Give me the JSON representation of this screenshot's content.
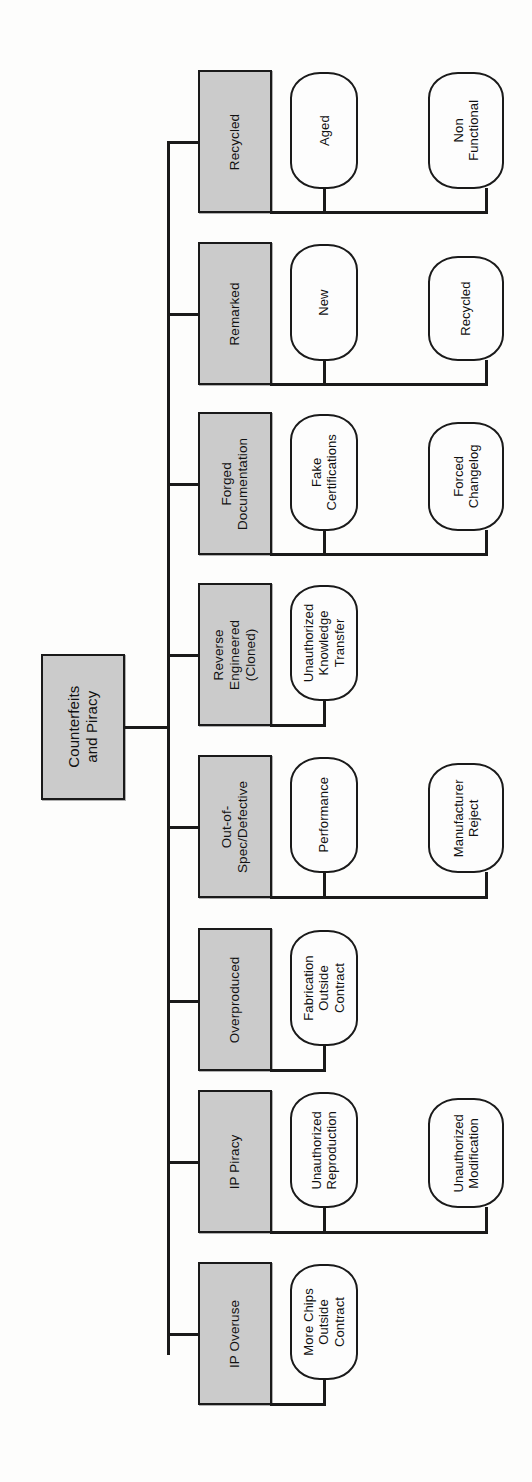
{
  "diagram": {
    "orientation": "rotated-90-ccw",
    "colors": {
      "node_fill_gray": "#cbcbcb",
      "leaf_fill": "#fdfdfd",
      "stroke": "#1a1a1a",
      "background": "#ffffff"
    },
    "root": {
      "label": "Counterfeits\nand Piracy"
    },
    "branches": [
      {
        "label": "Recycled",
        "leaves": [
          {
            "label": "Aged"
          },
          {
            "label": "Non\nFunctional"
          }
        ]
      },
      {
        "label": "Remarked",
        "leaves": [
          {
            "label": "New"
          },
          {
            "label": "Recycled"
          }
        ]
      },
      {
        "label": "Forged\nDocumentation",
        "leaves": [
          {
            "label": "Fake\nCertifications"
          },
          {
            "label": "Forced\nChangelog"
          }
        ]
      },
      {
        "label": "Reverse\nEngineered\n(Cloned)",
        "leaves": [
          {
            "label": "Unauthorized\nKnowledge\nTransfer"
          }
        ]
      },
      {
        "label": "Out-of-\nSpec/Defective",
        "leaves": [
          {
            "label": "Performance"
          },
          {
            "label": "Manufacturer\nReject"
          }
        ]
      },
      {
        "label": "Overproduced",
        "leaves": [
          {
            "label": "Fabrication\nOutside\nContract"
          }
        ]
      },
      {
        "label": "IP Piracy",
        "leaves": [
          {
            "label": "Unauthorized\nReproduction"
          },
          {
            "label": "Unauthorized\nModification"
          }
        ]
      },
      {
        "label": "IP Overuse",
        "leaves": [
          {
            "label": "More Chips\nOutside\nContract"
          }
        ]
      }
    ]
  }
}
